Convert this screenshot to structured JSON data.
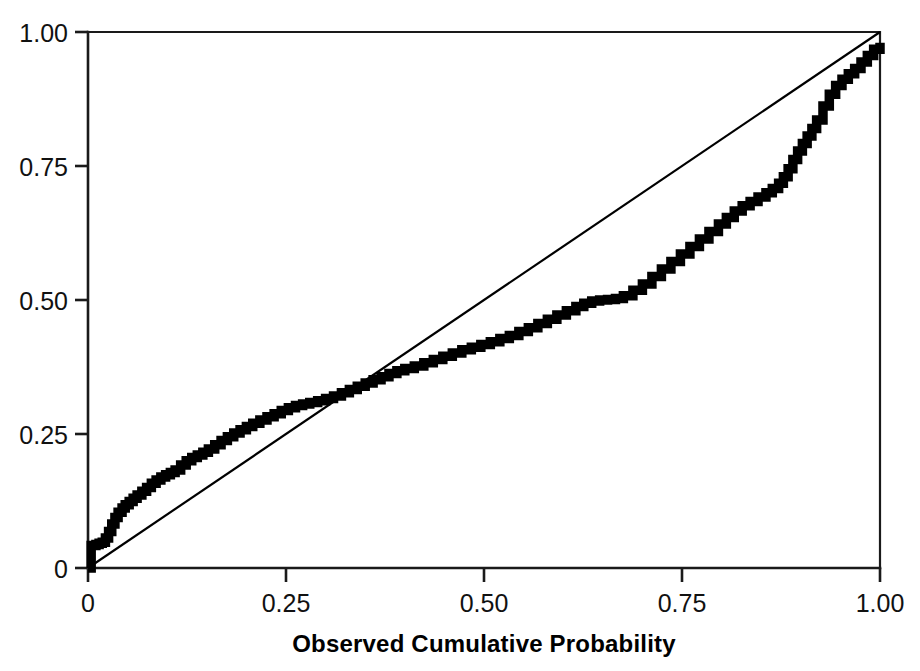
{
  "chart_data": {
    "type": "line",
    "title": "",
    "subtitle": "",
    "xlabel": "Observed Cumulative Probability",
    "ylabel": "",
    "xlim": [
      0,
      1.0
    ],
    "ylim": [
      0,
      1.0
    ],
    "grid": false,
    "legend": "none",
    "x_tick_labels": [
      "0",
      "0.25",
      "0.50",
      "0.75",
      "1.00"
    ],
    "x_tick_values": [
      0,
      0.25,
      0.5,
      0.75,
      1.0
    ],
    "y_tick_labels": [
      "0",
      "0.25",
      "0.50",
      "0.75",
      "1.00"
    ],
    "y_tick_values": [
      0,
      0.25,
      0.5,
      0.75,
      1.0
    ],
    "series": [
      {
        "name": "Expected Cumulative Probability",
        "style": "stepped-thick-line",
        "color": "#000000",
        "x": [
          0.0,
          0.004,
          0.004,
          0.01,
          0.014,
          0.018,
          0.022,
          0.026,
          0.03,
          0.034,
          0.038,
          0.043,
          0.047,
          0.052,
          0.057,
          0.062,
          0.068,
          0.074,
          0.08,
          0.086,
          0.092,
          0.098,
          0.104,
          0.11,
          0.117,
          0.124,
          0.131,
          0.138,
          0.145,
          0.152,
          0.16,
          0.168,
          0.176,
          0.184,
          0.192,
          0.2,
          0.208,
          0.217,
          0.226,
          0.235,
          0.244,
          0.253,
          0.262,
          0.271,
          0.28,
          0.29,
          0.3,
          0.31,
          0.32,
          0.33,
          0.34,
          0.35,
          0.36,
          0.37,
          0.38,
          0.39,
          0.4,
          0.412,
          0.424,
          0.436,
          0.448,
          0.46,
          0.472,
          0.484,
          0.496,
          0.508,
          0.52,
          0.532,
          0.544,
          0.556,
          0.568,
          0.58,
          0.592,
          0.604,
          0.616,
          0.626,
          0.636,
          0.646,
          0.656,
          0.666,
          0.676,
          0.688,
          0.7,
          0.712,
          0.724,
          0.736,
          0.748,
          0.76,
          0.772,
          0.784,
          0.796,
          0.806,
          0.816,
          0.826,
          0.836,
          0.846,
          0.856,
          0.864,
          0.872,
          0.878,
          0.884,
          0.89,
          0.896,
          0.902,
          0.908,
          0.914,
          0.92,
          0.928,
          0.936,
          0.944,
          0.952,
          0.96,
          0.968,
          0.976,
          0.984,
          0.992,
          1.0
        ],
        "y": [
          0.0,
          0.01,
          0.042,
          0.044,
          0.046,
          0.048,
          0.056,
          0.068,
          0.082,
          0.094,
          0.104,
          0.112,
          0.118,
          0.124,
          0.13,
          0.136,
          0.143,
          0.15,
          0.158,
          0.164,
          0.17,
          0.174,
          0.178,
          0.183,
          0.192,
          0.2,
          0.206,
          0.211,
          0.216,
          0.222,
          0.23,
          0.238,
          0.245,
          0.252,
          0.258,
          0.264,
          0.27,
          0.276,
          0.282,
          0.288,
          0.294,
          0.299,
          0.303,
          0.306,
          0.309,
          0.312,
          0.316,
          0.321,
          0.327,
          0.333,
          0.339,
          0.345,
          0.351,
          0.357,
          0.363,
          0.368,
          0.372,
          0.377,
          0.383,
          0.389,
          0.395,
          0.401,
          0.407,
          0.412,
          0.417,
          0.422,
          0.428,
          0.434,
          0.441,
          0.448,
          0.456,
          0.464,
          0.472,
          0.48,
          0.488,
          0.494,
          0.498,
          0.5,
          0.501,
          0.503,
          0.508,
          0.518,
          0.53,
          0.544,
          0.558,
          0.572,
          0.586,
          0.6,
          0.614,
          0.628,
          0.642,
          0.654,
          0.666,
          0.676,
          0.684,
          0.692,
          0.7,
          0.708,
          0.718,
          0.73,
          0.745,
          0.762,
          0.778,
          0.792,
          0.806,
          0.82,
          0.836,
          0.862,
          0.884,
          0.9,
          0.912,
          0.922,
          0.932,
          0.944,
          0.956,
          0.968,
          0.98
        ]
      },
      {
        "name": "reference-diagonal",
        "style": "thin-line",
        "color": "#000000",
        "x": [
          0.0,
          1.0
        ],
        "y": [
          0.0,
          1.0
        ]
      }
    ]
  },
  "axes": {
    "x_title": "Observed Cumulative Probability",
    "y_title": ""
  }
}
